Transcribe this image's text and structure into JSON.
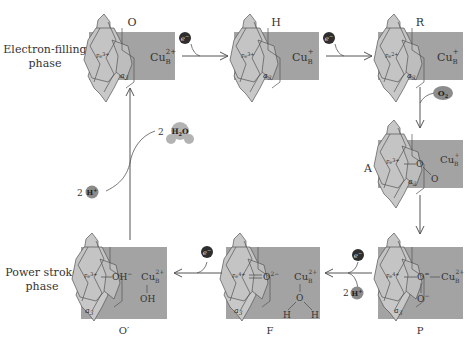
{
  "phases": {
    "top": [
      "Electron-filling",
      "phase"
    ],
    "bottom": [
      "Power stroke",
      "phase"
    ]
  },
  "states": [
    {
      "id": "O",
      "label": "O",
      "fe": "Fe",
      "fe_charge": "3+",
      "cu": "Cu",
      "cu_sub": "B",
      "cu_charge": "2+",
      "heme": "a",
      "heme_sub": "3"
    },
    {
      "id": "H",
      "label": "H",
      "fe": "Fe",
      "fe_charge": "3+",
      "cu": "Cu",
      "cu_sub": "B",
      "cu_charge": "+",
      "heme": "a",
      "heme_sub": "3"
    },
    {
      "id": "R",
      "label": "R",
      "fe": "Fe",
      "fe_charge": "2+",
      "cu": "Cu",
      "cu_sub": "B",
      "cu_charge": "+",
      "heme": "a",
      "heme_sub": "3"
    },
    {
      "id": "A",
      "label": "A",
      "fe": "Fe",
      "fe_charge": "3+",
      "cu": "Cu",
      "cu_sub": "B",
      "cu_charge": "+",
      "heme": "a",
      "heme_sub": "3",
      "ligand1": "O",
      "ligand2": "O"
    },
    {
      "id": "P",
      "label": "P",
      "fe": "Fe",
      "fe_charge": "4+",
      "cu": "Cu",
      "cu_sub": "B",
      "cu_charge": "2+",
      "heme": "a",
      "heme_sub": "3",
      "ligand1": "O",
      "ligand1_charge": "=",
      "ligand2": "O",
      "ligand2_charge": "−"
    },
    {
      "id": "F",
      "label": "F",
      "fe": "Fe",
      "fe_charge": "4+",
      "cu": "Cu",
      "cu_sub": "B",
      "cu_charge": "2+",
      "heme": "a",
      "heme_sub": "3",
      "ligand1": "O",
      "ligand1_charge": "2−",
      "water_o": "O",
      "water_h": "H"
    },
    {
      "id": "O'",
      "label": "O′",
      "fe": "Fe",
      "fe_charge": "3+",
      "cu": "Cu",
      "cu_sub": "B",
      "cu_charge": "2+",
      "heme": "a",
      "heme_sub": "3",
      "ligand1": "OH",
      "ligand1_charge": "−",
      "cu_ligand": "OH"
    }
  ],
  "species": {
    "electron": "e",
    "electron_charge": "−",
    "oxygen": "O",
    "oxygen_sub": "2",
    "proton": "H",
    "proton_charge": "+",
    "proton_count": "2",
    "water_count": "2",
    "water": "H",
    "water_sub": "2",
    "water_o": "O"
  },
  "colors": {
    "box": "#a3a3a3",
    "heme_fill": "#c8c8c8",
    "heme_stroke": "#555555",
    "electron": "#2e2e2e",
    "oxygen": "#8c8c8c",
    "proton": "#8a8a8a",
    "water": "#b3b3b3",
    "arrow": "#555555"
  }
}
